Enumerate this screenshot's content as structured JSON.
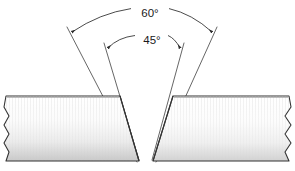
{
  "diagram": {
    "background_color": "#ffffff",
    "outline_color": "#333333",
    "line_color": "#4a4a4a",
    "label_color": "#1a1a1a",
    "fill_top_color": "#ffffff",
    "fill_bottom_color": "#c9c9c9",
    "dimensions": [
      {
        "id": "included-angle",
        "label": "60°",
        "value": 60,
        "unit": "degrees",
        "label_x": 150,
        "label_y": 14,
        "arc": "M 72 32 Q 150 -2 212 32",
        "arrow_left_x": 72,
        "arrow_left_y": 32,
        "arrow_right_x": 212,
        "arrow_right_y": 32,
        "gap_start_x": 131,
        "gap_end_x": 169
      },
      {
        "id": "bevel-angle",
        "label": "45°",
        "value": 45,
        "unit": "degrees",
        "label_x": 152,
        "label_y": 41,
        "arc": "M 108 48 Q 150 22 180 48",
        "arrow_left_x": 108,
        "arrow_left_y": 48,
        "arrow_right_x": 180,
        "arrow_right_y": 48,
        "gap_start_x": 135,
        "gap_end_x": 168
      }
    ],
    "extension_lines": [
      {
        "id": "ext-outer-left",
        "x1": 67,
        "y1": 27,
        "x2": 137,
        "y2": 162
      },
      {
        "id": "ext-inner-left",
        "x1": 104,
        "y1": 43,
        "x2": 139,
        "y2": 160
      },
      {
        "id": "ext-inner-right",
        "x1": 184,
        "y1": 43,
        "x2": 152,
        "y2": 160
      },
      {
        "id": "ext-outer-right",
        "x1": 217,
        "y1": 27,
        "x2": 156,
        "y2": 162
      }
    ],
    "plates": [
      {
        "id": "left-plate",
        "label": "left base metal",
        "outline": "M 6 96 L 120 96 L 139 161 L 6 161 L 9 152 L 4 143 L 9 134 L 4 125 L 9 116 L 4 107 Z"
      },
      {
        "id": "right-plate",
        "label": "right base metal",
        "outline": "M 289 96 L 173 96 L 153 161 L 289 161 L 285 152 L 291 143 L 285 134 L 291 125 L 285 116 L 291 107 Z"
      }
    ],
    "bevel_faces": [
      {
        "id": "left-bevel-face",
        "path": "M 120 96 L 139 161"
      },
      {
        "id": "right-bevel-face",
        "path": "M 173 96 L 153 161"
      }
    ],
    "root_gap": {
      "id": "root-opening",
      "left_x": 139,
      "right_x": 153,
      "y": 161
    }
  }
}
